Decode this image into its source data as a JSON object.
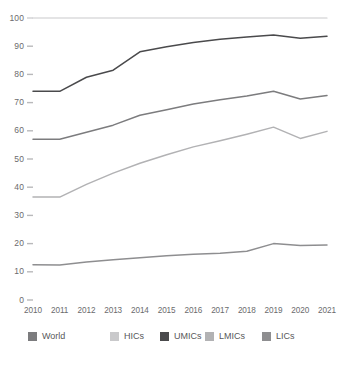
{
  "chart_data": {
    "type": "line",
    "title": "",
    "subtitle": "",
    "xlabel": "",
    "ylabel": "",
    "x": [
      2010,
      2011,
      2012,
      2013,
      2014,
      2015,
      2016,
      2017,
      2018,
      2019,
      2020,
      2021
    ],
    "categories": [
      "2010",
      "2011",
      "2012",
      "2013",
      "2014",
      "2015",
      "2016",
      "2017",
      "2018",
      "2019",
      "2020",
      "2021"
    ],
    "xlim": [
      2010,
      2021
    ],
    "ylim": [
      0,
      100
    ],
    "yticks": [
      0,
      10,
      20,
      30,
      40,
      50,
      60,
      70,
      80,
      90,
      100
    ],
    "ytick_labels": [
      "0",
      "10",
      "20",
      "30",
      "40",
      "50",
      "60",
      "70",
      "80",
      "90",
      "100"
    ],
    "grid": false,
    "legend_position": "bottom",
    "series": [
      {
        "name": "World",
        "color": "#7c7c7e",
        "values": [
          57.0,
          57.0,
          59.5,
          62.0,
          65.5,
          67.5,
          69.5,
          71.0,
          72.3,
          74.0,
          71.3,
          72.5
        ]
      },
      {
        "name": "HICs",
        "color": "#c9c9cb",
        "values": [
          100.0,
          100.0,
          100.0,
          100.0,
          100.0,
          100.0,
          100.0,
          100.0,
          100.0,
          100.0,
          100.0,
          100.0
        ]
      },
      {
        "name": "UMICs",
        "color": "#4a4a4c",
        "values": [
          74.0,
          74.0,
          79.0,
          81.5,
          88.0,
          89.8,
          91.3,
          92.5,
          93.3,
          94.0,
          92.8,
          93.5
        ]
      },
      {
        "name": "LMICs",
        "color": "#b2b2b4",
        "values": [
          36.5,
          36.5,
          41.0,
          45.0,
          48.5,
          51.5,
          54.3,
          56.5,
          58.8,
          61.3,
          57.3,
          59.8
        ]
      },
      {
        "name": "LICs",
        "color": "#8e8e90",
        "values": [
          12.5,
          12.4,
          13.5,
          14.3,
          15.0,
          15.7,
          16.2,
          16.6,
          17.3,
          20.0,
          19.3,
          19.5
        ]
      }
    ]
  },
  "legend": {
    "items": [
      {
        "label": "World",
        "color": "#7c7c7e"
      },
      {
        "label": "HICs",
        "color": "#c9c9cb"
      },
      {
        "label": "UMICs",
        "color": "#4a4a4c"
      },
      {
        "label": "LMICs",
        "color": "#b2b2b4"
      },
      {
        "label": "LICs",
        "color": "#8e8e90"
      }
    ]
  }
}
